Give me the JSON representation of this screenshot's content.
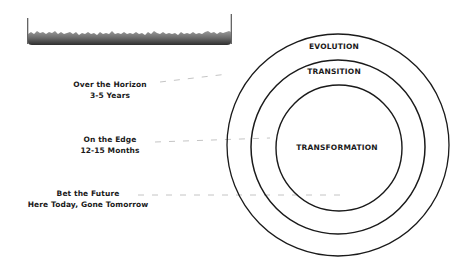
{
  "header": {
    "name": "decorative-header-bar",
    "color": "#3a3a3a"
  },
  "labels": [
    {
      "id": "horizon",
      "title": "Over the Horizon",
      "subtitle": "3-5 Years"
    },
    {
      "id": "edge",
      "title": "On the Edge",
      "subtitle": "12-15 Months"
    },
    {
      "id": "future",
      "title": "Bet the Future",
      "subtitle": "Here Today, Gone Tomorrow"
    }
  ],
  "rings": {
    "outer": "EVOLUTION",
    "middle": "TRANSITION",
    "inner": "TRANSFORMATION"
  },
  "colors": {
    "stroke": "#1a1a1a",
    "connector": "#b5b5b5"
  }
}
